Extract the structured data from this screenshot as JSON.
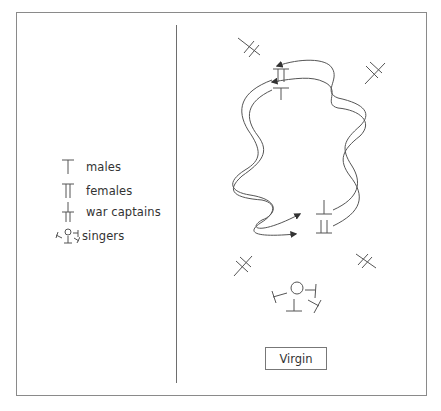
{
  "legend": {
    "items": [
      {
        "symbol": "male-symbol",
        "label": "males"
      },
      {
        "symbol": "female-symbol",
        "label": "females"
      },
      {
        "symbol": "war-captain-symbol",
        "label": "war captains"
      },
      {
        "symbol": "singers-symbol",
        "label": "singers"
      }
    ]
  },
  "diagram": {
    "center_label": "Virgin",
    "elements": [
      "war-captain (top-left)",
      "war-captain (top-right)",
      "war-captain (bottom-left)",
      "war-captain (bottom-right)",
      "female + male pair (top, left line start)",
      "male + female pair (bottom right, right line start)",
      "left intertwined dance path with arrows pointing right at bottom",
      "right intertwined dance path with arrows pointing left at top",
      "singers group (circle with four males)"
    ]
  },
  "colors": {
    "line": "#555555",
    "frame": "#8a8a8a",
    "text": "#333333"
  }
}
